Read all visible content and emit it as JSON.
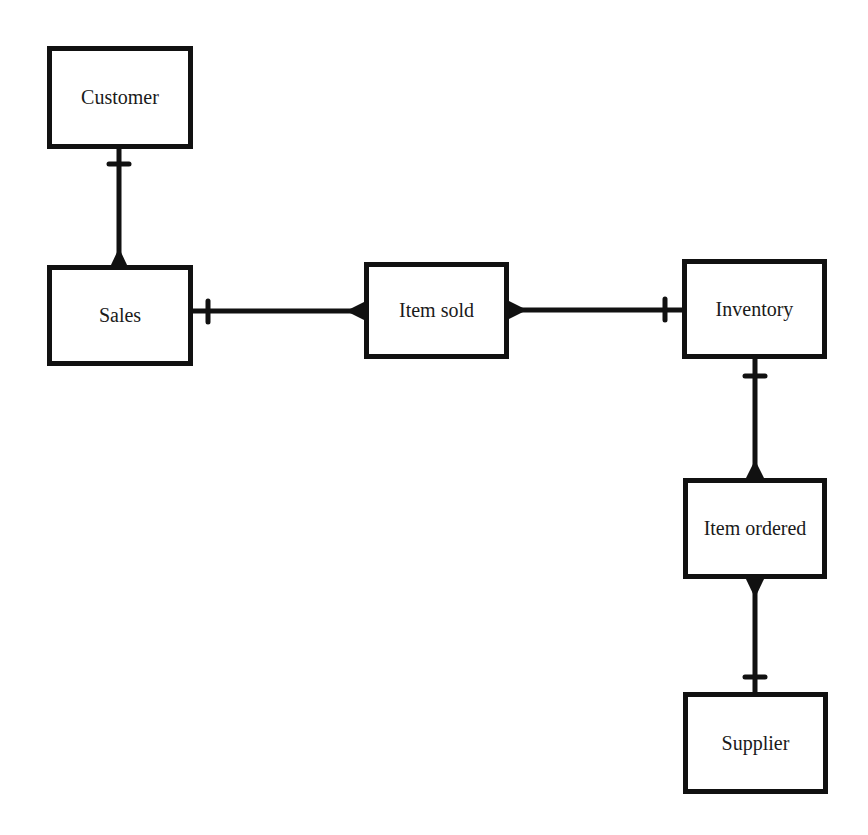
{
  "diagram": {
    "type": "entity-relationship",
    "entities": [
      {
        "id": "customer",
        "label": "Customer",
        "x": 47,
        "y": 46,
        "w": 146,
        "h": 103
      },
      {
        "id": "sales",
        "label": "Sales",
        "x": 47,
        "y": 265,
        "w": 146,
        "h": 101
      },
      {
        "id": "item_sold",
        "label": "Item sold",
        "x": 364,
        "y": 262,
        "w": 145,
        "h": 97
      },
      {
        "id": "inventory",
        "label": "Inventory",
        "x": 682,
        "y": 259,
        "w": 145,
        "h": 100
      },
      {
        "id": "item_ordered",
        "label": "Item ordered",
        "x": 683,
        "y": 478,
        "w": 144,
        "h": 101
      },
      {
        "id": "supplier",
        "label": "Supplier",
        "x": 683,
        "y": 692,
        "w": 145,
        "h": 102
      }
    ],
    "relationships": [
      {
        "from": "customer",
        "to": "sales",
        "from_cardinality": "one",
        "to_cardinality": "many"
      },
      {
        "from": "sales",
        "to": "item_sold",
        "from_cardinality": "one",
        "to_cardinality": "many"
      },
      {
        "from": "item_sold",
        "to": "inventory",
        "from_cardinality": "many",
        "to_cardinality": "one"
      },
      {
        "from": "inventory",
        "to": "item_ordered",
        "from_cardinality": "one",
        "to_cardinality": "many"
      },
      {
        "from": "item_ordered",
        "to": "supplier",
        "from_cardinality": "many",
        "to_cardinality": "one"
      }
    ],
    "line_color": "#111111"
  }
}
